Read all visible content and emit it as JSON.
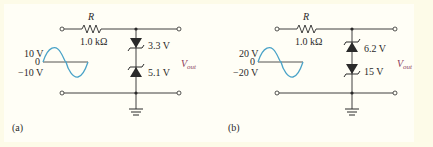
{
  "figure": {
    "colors": {
      "background": "#fdfbe8",
      "panel": "#fffef6",
      "wire": "#2a2a2a",
      "sine": "#4aa3c8",
      "vout": "#8b3a5a"
    },
    "circuits": [
      {
        "id": "a",
        "caption": "(a)",
        "resistor": {
          "symbol": "R",
          "value": "1.0 kΩ"
        },
        "source": {
          "peak_label": "10 V",
          "zero_label": "0",
          "trough_label": "−10 V"
        },
        "zener_top": {
          "label": "3.3 V",
          "orientation": "cathode-down"
        },
        "zener_bottom": {
          "label": "5.1 V",
          "orientation": "cathode-up"
        },
        "output_label": {
          "main": "V",
          "sub": "out"
        }
      },
      {
        "id": "b",
        "caption": "(b)",
        "resistor": {
          "symbol": "R",
          "value": "1.0 kΩ"
        },
        "source": {
          "peak_label": "20 V",
          "zero_label": "0",
          "trough_label": "−20 V"
        },
        "zener_top": {
          "label": "6.2 V",
          "orientation": "cathode-up"
        },
        "zener_bottom": {
          "label": "15 V",
          "orientation": "cathode-down"
        },
        "output_label": {
          "main": "V",
          "sub": "out"
        }
      }
    ]
  }
}
